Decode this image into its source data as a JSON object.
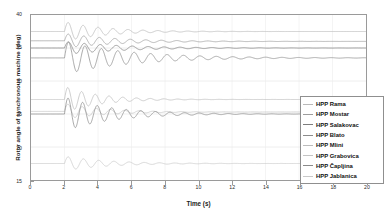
{
  "chart_data": {
    "type": "line",
    "title": "",
    "xlabel": "Time (s)",
    "ylabel": "Rotor angle of synchronous machine (deg)",
    "xlim": [
      0,
      20
    ],
    "ylim": [
      15,
      40
    ],
    "xticks": [
      0,
      2,
      4,
      6,
      8,
      10,
      12,
      14,
      16,
      18,
      20
    ],
    "yticks": [
      15,
      20,
      25,
      30,
      35,
      40
    ],
    "grid": true,
    "legend_position": "right",
    "fault_time": 2.0,
    "series": [
      {
        "name": "HPP Rama",
        "color": "#b9b9b9",
        "pre_fault": 37.5,
        "steady": 37.5,
        "peak": 39.0,
        "damping": 0.42,
        "frequency": 1.12,
        "phase": 0.0
      },
      {
        "name": "HPP Mostar",
        "color": "#9d9d9d",
        "pre_fault": 36.1,
        "steady": 36.0,
        "peak": 37.2,
        "damping": 0.33,
        "frequency": 1.08,
        "phase": 0.0
      },
      {
        "name": "HPP Salakovac",
        "color": "#7d7d7d",
        "pre_fault": 35.0,
        "steady": 35.0,
        "peak": 36.0,
        "damping": 0.3,
        "frequency": 1.05,
        "phase": 0.0
      },
      {
        "name": "HPP Blato",
        "color": "#8c8c8c",
        "pre_fault": 33.5,
        "steady": 33.5,
        "peak": 36.0,
        "damping": 0.26,
        "frequency": 1.02,
        "phase": 0.0
      },
      {
        "name": "HPP Mlini",
        "color": "#bcbcbc",
        "pre_fault": 27.2,
        "steady": 27.2,
        "peak": 29.2,
        "damping": 0.5,
        "frequency": 1.22,
        "phase": 0.0
      },
      {
        "name": "HPP Grabovica",
        "color": "#c4c4c4",
        "pre_fault": 25.4,
        "steady": 25.3,
        "peak": 26.6,
        "damping": 0.44,
        "frequency": 1.18,
        "phase": 0.0
      },
      {
        "name": "HPP Čapljina",
        "color": "#8a8a8a",
        "pre_fault": 25.0,
        "steady": 25.0,
        "peak": 27.6,
        "damping": 0.36,
        "frequency": 1.15,
        "phase": 0.0
      },
      {
        "name": "HPP Jablanica",
        "color": "#c9c9c9",
        "pre_fault": 17.5,
        "steady": 17.5,
        "peak": 18.6,
        "damping": 0.4,
        "frequency": 1.1,
        "phase": 0.0
      }
    ]
  },
  "axis": {
    "xlabel": "Time (s)",
    "ylabel": "Rotor angle of synchronous machine (deg)"
  }
}
